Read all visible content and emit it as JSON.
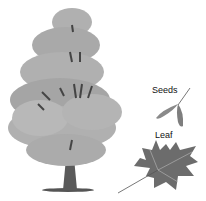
{
  "illustration": {
    "subject": "maple tree",
    "labels": {
      "seeds": "Seeds",
      "leaf": "Leaf"
    },
    "colors": {
      "foliage": "#a8a8a8",
      "foliage_dark": "#7a7a7a",
      "trunk": "#555555",
      "leaf": "#6a6a6a",
      "seeds": "#8a8a8a"
    }
  }
}
